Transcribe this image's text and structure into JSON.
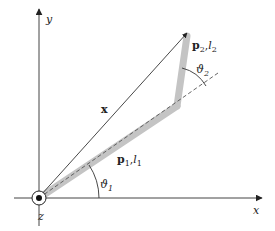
{
  "diagram": {
    "type": "two-link planar manipulator",
    "colors": {
      "axis": "#444444",
      "link": "#c4c4c4",
      "vector": "#333333",
      "dashed": "#555555",
      "text": "#222222",
      "background": "#ffffff"
    },
    "axes": {
      "x_label": "x",
      "y_label": "y",
      "z_label": "z"
    },
    "vector": {
      "label": "x"
    },
    "links": [
      {
        "name": "link-1",
        "vector_label": "p",
        "vector_sub": "1",
        "length_label": "l",
        "length_sub": "1",
        "separator": ","
      },
      {
        "name": "link-2",
        "vector_label": "p",
        "vector_sub": "2",
        "length_label": "l",
        "length_sub": "2",
        "separator": ","
      }
    ],
    "angles": [
      {
        "name": "theta-1",
        "symbol": "ϑ",
        "sub": "1"
      },
      {
        "name": "theta-2",
        "symbol": "ϑ",
        "sub": "2"
      }
    ]
  }
}
